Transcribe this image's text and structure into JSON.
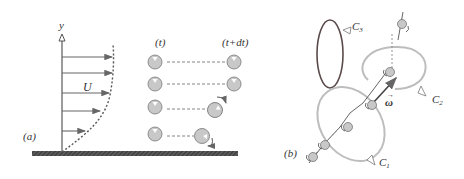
{
  "panel_a": {
    "label": "(a)",
    "axis_label": "y",
    "velocity_label": "U",
    "time_t": "(t)",
    "time_t_dt": "(t+dt)",
    "profile_arrows": [
      {
        "y": 57,
        "x2": 112
      },
      {
        "y": 73,
        "x2": 112
      },
      {
        "y": 93,
        "x2": 109
      },
      {
        "y": 111,
        "x2": 100
      },
      {
        "y": 131,
        "x2": 85
      }
    ],
    "particles": [
      {
        "y": 62,
        "start_x": 155,
        "end_x": 236,
        "rotating": false
      },
      {
        "y": 84,
        "start_x": 155,
        "end_x": 236,
        "rotating": false
      },
      {
        "y": 107,
        "start_x": 155,
        "end_x": 216,
        "rotating": true
      },
      {
        "y": 134,
        "start_x": 155,
        "end_x": 203,
        "rotating": true
      }
    ]
  },
  "panel_b": {
    "label": "(b)",
    "loops": [
      {
        "name": "C₁",
        "sub": "1",
        "text": "C"
      },
      {
        "name": "C₂",
        "sub": "2",
        "text": "C"
      },
      {
        "name": "C₃",
        "sub": "3",
        "text": "C"
      }
    ],
    "vorticity_label": "ω"
  },
  "colors": {
    "line": "#555555",
    "particle_fill": "#c8c8c8",
    "loop_light": "#bdbdbd",
    "loop_dark": "#5a4a4a",
    "wall": "#4a4a4a"
  }
}
